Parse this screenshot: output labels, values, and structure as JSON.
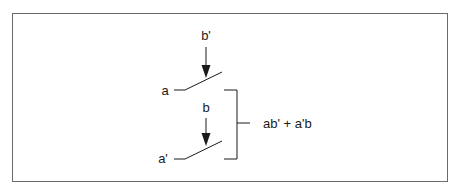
{
  "diagram": {
    "type": "switch-circuit",
    "frame": {
      "border_color": "#6a6a6a"
    },
    "switches": [
      {
        "id": "top",
        "input_label": "a",
        "control_label": "b'"
      },
      {
        "id": "bottom",
        "input_label": "a'",
        "control_label": "b"
      }
    ],
    "output_label": "ab' + a'b",
    "line_color": "#1a1a1a"
  }
}
